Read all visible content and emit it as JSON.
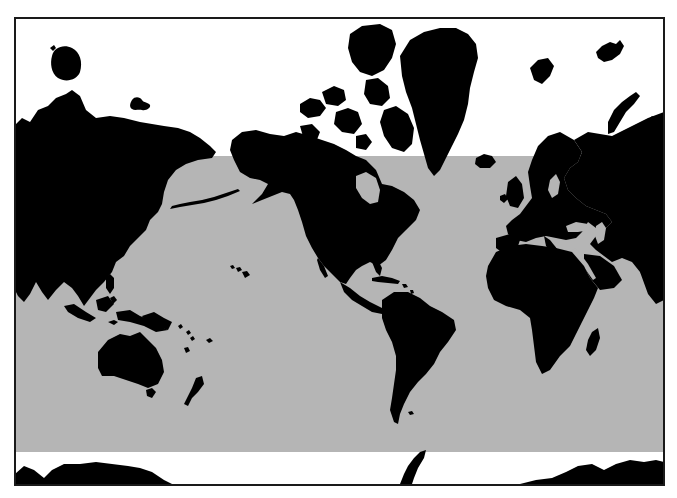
{
  "map": {
    "projection": "Mercator",
    "style": "black land silhouettes on white, gray shaded latitude band",
    "colors": {
      "land": "#000000",
      "ocean_outside_band": "#ffffff",
      "band": "#b5b5b5",
      "frame": "#1a1a1a"
    },
    "frame": {
      "x": 14,
      "y": 17,
      "width": 651,
      "height": 469
    },
    "band": {
      "x": 15,
      "y": 156,
      "width": 649,
      "height": 296
    },
    "regions": [
      "north-america",
      "greenland",
      "canadian-arctic-archipelago",
      "south-america",
      "europe",
      "africa",
      "madagascar",
      "asia",
      "japan",
      "southeast-asia-islands",
      "australia",
      "new-zealand",
      "hawaii",
      "svalbard",
      "franz-josef-land",
      "novaya-zemlya",
      "iceland",
      "british-isles",
      "wrangel-island",
      "new-siberian-islands",
      "antarctica"
    ]
  }
}
